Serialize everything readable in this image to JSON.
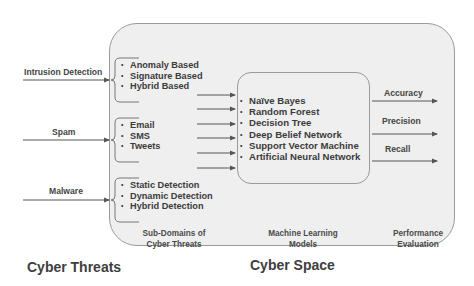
{
  "threats": [
    {
      "label": "Intrusion Detection",
      "sub_items": [
        "Anomaly Based",
        "Signature Based",
        "Hybrid Based"
      ]
    },
    {
      "label": "Spam",
      "sub_items": [
        "Email",
        "SMS",
        "Tweets"
      ]
    },
    {
      "label": "Malware",
      "sub_items": [
        "Static Detection",
        "Dynamic Detection",
        "Hybrid Detection"
      ]
    }
  ],
  "ml_models": [
    "Naïve Bayes",
    "Random Forest",
    "Decision Tree",
    "Deep Belief Network",
    "Support Vector Machine",
    "Artificial Neural Network"
  ],
  "metrics": [
    "Accuracy",
    "Precision",
    "Recall"
  ],
  "captions": {
    "subdomains_line1": "Sub-Domains of",
    "subdomains_line2": "Cyber Threats",
    "ml_line1": "Machine Learning",
    "ml_line2": "Models",
    "perf_line1": "Performance",
    "perf_line2": "Evaluation"
  },
  "region_titles": {
    "cyber_threats": "Cyber Threats",
    "cyber_space": "Cyber Space"
  },
  "colors": {
    "box_fill": "#efefef",
    "box_border": "#9a9a9a",
    "arrow": "#555555",
    "text": "#3c3c3c"
  }
}
